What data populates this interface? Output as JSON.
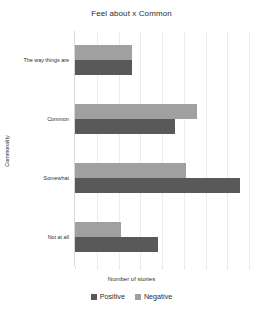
{
  "chart_data": {
    "type": "bar",
    "orientation": "horizontal",
    "title": "Feel about x Common",
    "xlabel": "Number of stories",
    "ylabel": "Commonality",
    "categories": [
      "The way things are",
      "Common",
      "Somewhat",
      "Not at all"
    ],
    "series": [
      {
        "name": "Positive",
        "color": "#595959",
        "values": [
          2.6,
          4.6,
          7.6,
          3.8
        ]
      },
      {
        "name": "Negative",
        "color": "#a0a0a0",
        "values": [
          2.6,
          5.6,
          5.1,
          2.1
        ]
      }
    ],
    "xlim": [
      0,
      8
    ],
    "xticks": [
      0,
      1,
      2,
      3,
      4,
      5,
      6,
      7,
      8
    ],
    "grid": true,
    "legend_position": "bottom",
    "bar_order_in_group": [
      "Negative",
      "Positive"
    ]
  },
  "legend": {
    "items": [
      {
        "label": "Positive",
        "color": "#595959"
      },
      {
        "label": "Negative",
        "color": "#a0a0a0"
      }
    ]
  }
}
